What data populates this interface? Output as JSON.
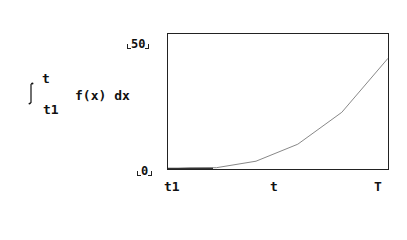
{
  "chart_data": {
    "type": "line",
    "title": "",
    "ylabel": "∫ from t1 to t f(x) dx",
    "ylabel_parts": {
      "upper_limit": "t",
      "lower_limit": "t1",
      "integrand": "f(x) dx"
    },
    "xlabel": "",
    "x_tick_labels": [
      "t1",
      "t",
      "T"
    ],
    "y_tick_labels": [
      "0",
      "50"
    ],
    "ylim": [
      0,
      50
    ],
    "xlim": [
      0,
      1
    ],
    "grid": false,
    "legend": null,
    "x": [
      0.0,
      0.1,
      0.22,
      0.4,
      0.59,
      0.79,
      1.0
    ],
    "values": [
      0,
      0.4,
      0.5,
      2.9,
      9.2,
      21,
      41
    ],
    "line_color": "#888888"
  },
  "labels": {
    "y_max": "50",
    "y_min": "0",
    "x_start": "t1",
    "x_mid": "t",
    "x_end": "T",
    "upper_limit": "t",
    "lower_limit": "t1",
    "integrand": "f(x) dx"
  }
}
